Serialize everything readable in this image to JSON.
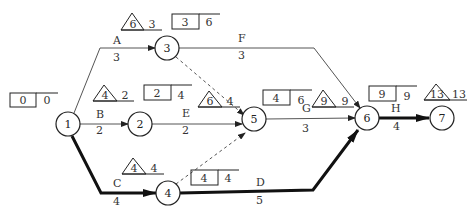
{
  "diagram": {
    "type": "activity-on-arrow network (critical path)",
    "nodes": [
      {
        "id": "1",
        "label": "1",
        "x": 68,
        "y": 124
      },
      {
        "id": "2",
        "label": "2",
        "x": 140,
        "y": 124
      },
      {
        "id": "3",
        "label": "3",
        "x": 167,
        "y": 48
      },
      {
        "id": "4",
        "label": "4",
        "x": 168,
        "y": 193
      },
      {
        "id": "5",
        "label": "5",
        "x": 254,
        "y": 124
      },
      {
        "id": "6",
        "label": "6",
        "x": 367,
        "y": 118
      },
      {
        "id": "7",
        "label": "7",
        "x": 442,
        "y": 118
      }
    ],
    "activities": [
      {
        "name": "A",
        "duration": "3",
        "from": "1",
        "to": "3",
        "critical": false
      },
      {
        "name": "B",
        "duration": "2",
        "from": "1",
        "to": "2",
        "critical": false
      },
      {
        "name": "C",
        "duration": "4",
        "from": "1",
        "to": "4",
        "critical": true
      },
      {
        "name": "D",
        "duration": "5",
        "from": "4",
        "to": "6",
        "critical": true
      },
      {
        "name": "E",
        "duration": "2",
        "from": "2",
        "to": "5",
        "critical": false
      },
      {
        "name": "F",
        "duration": "3",
        "from": "3",
        "to": "6",
        "critical": false
      },
      {
        "name": "G",
        "duration": "3",
        "from": "5",
        "to": "6",
        "critical": false
      },
      {
        "name": "H",
        "duration": "4",
        "from": "6",
        "to": "7",
        "critical": true
      }
    ],
    "dummies": [
      {
        "from": "3",
        "to": "5"
      },
      {
        "from": "4",
        "to": "5"
      }
    ],
    "early_times": [
      {
        "node": "1",
        "box": "0",
        "side": "0"
      },
      {
        "node": "3",
        "box": "3",
        "side": "6"
      },
      {
        "node": "2",
        "box": "2",
        "side": "4"
      },
      {
        "node": "5",
        "box": "4",
        "side": "6"
      },
      {
        "node": "4",
        "box": "4",
        "side": "4"
      },
      {
        "node": "6",
        "box": "9",
        "side": "9"
      }
    ],
    "late_times": [
      {
        "node": "3",
        "tri": "6",
        "side": "3"
      },
      {
        "node": "2",
        "tri": "4",
        "side": "2"
      },
      {
        "node": "5",
        "tri": "6",
        "side": "4"
      },
      {
        "node": "4",
        "tri": "4",
        "side": "4"
      },
      {
        "node": "6",
        "tri": "9",
        "side": "9"
      },
      {
        "node": "7",
        "tri": "13",
        "side": "13"
      }
    ]
  }
}
